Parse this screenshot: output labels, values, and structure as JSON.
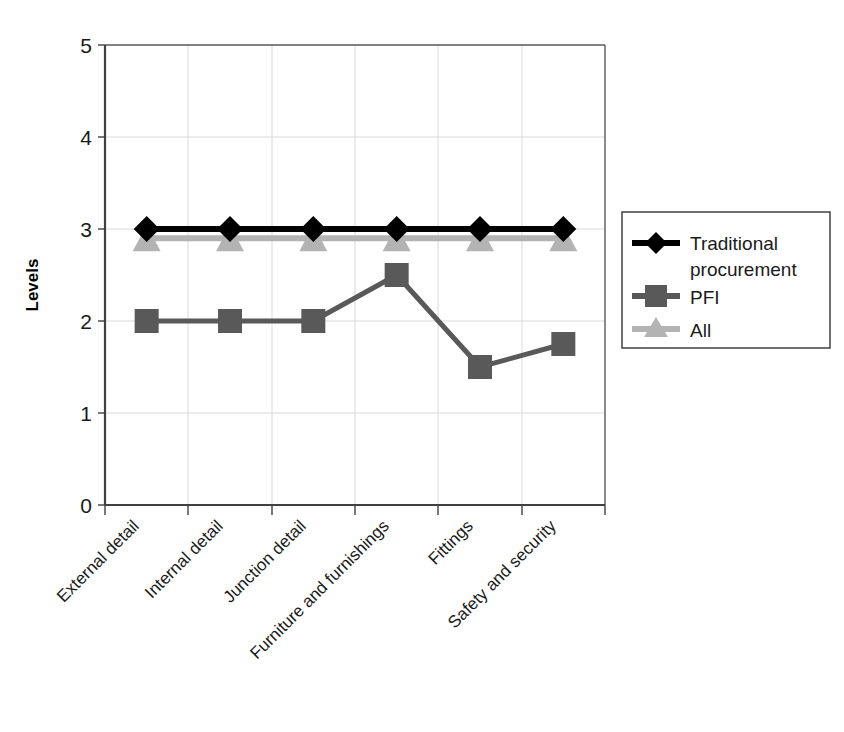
{
  "chart_data": {
    "type": "line",
    "title": "",
    "xlabel": "",
    "ylabel": "Levels",
    "ylim": [
      0,
      5
    ],
    "ytick_labels": [
      "0",
      "1",
      "2",
      "3",
      "4",
      "5"
    ],
    "ytick_values": [
      0,
      1,
      2,
      3,
      4,
      5
    ],
    "grid": true,
    "grid_axes": "both",
    "legend_position": "right",
    "categories": [
      "External detail",
      "Internal detail",
      "Junction detail",
      "Furniture and furnishings",
      "Fittings",
      "Safety and security"
    ],
    "series": [
      {
        "name": "Traditional procurement",
        "values": [
          3,
          3,
          3,
          3,
          3,
          3
        ],
        "color": "#000000",
        "marker": "diamond"
      },
      {
        "name": "PFI",
        "values": [
          2,
          2,
          2,
          2.5,
          1.5,
          1.75
        ],
        "color": "#595959",
        "marker": "square"
      },
      {
        "name": "All",
        "values": [
          2.9,
          2.9,
          2.9,
          2.9,
          2.9,
          2.9
        ],
        "color": "#b3b3b3",
        "marker": "triangle"
      }
    ]
  },
  "axes": {
    "y_axis_title": "Levels",
    "y_ticks": [
      "5",
      "4",
      "3",
      "2",
      "1",
      "0"
    ],
    "x_categories": [
      "External detail",
      "Internal detail",
      "Junction detail",
      "Furniture and furnishings",
      "Fittings",
      "Safety and security"
    ]
  },
  "legend": {
    "entries": [
      {
        "label_line1": "Traditional",
        "label_line2": "procurement",
        "marker": "diamond-marker",
        "color": "#000000"
      },
      {
        "label_line1": "PFI",
        "label_line2": "",
        "marker": "square-marker",
        "color": "#595959"
      },
      {
        "label_line1": "All",
        "label_line2": "",
        "marker": "triangle-marker",
        "color": "#b3b3b3"
      }
    ]
  },
  "colors": {
    "axis": "#404040",
    "gridline": "#d9d9d9",
    "plot_background": "#ffffff",
    "legend_border": "#404040",
    "text": "#1a1a1a"
  }
}
